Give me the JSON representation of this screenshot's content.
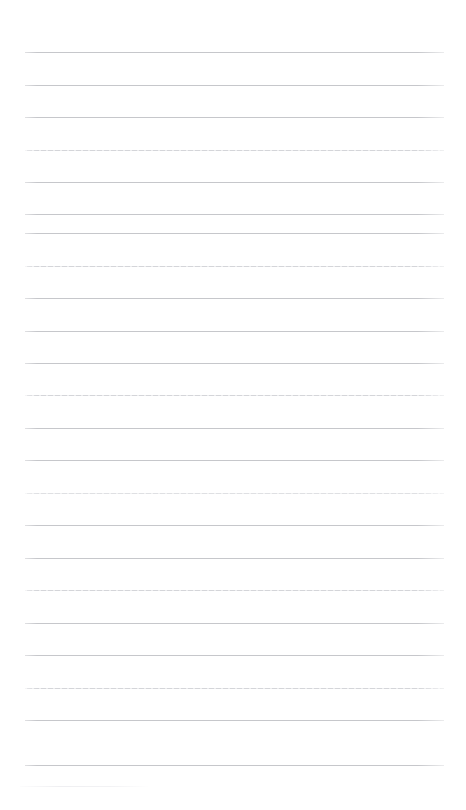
{
  "document": {
    "kind": "ruled-notebook-page",
    "title": "Blank ruled notebook page",
    "page_width": 466,
    "page_height": 810,
    "background_color": "#ffffff",
    "has_text_content": false,
    "has_header": false,
    "has_margin_rule": false,
    "written_text": ""
  },
  "ruling": {
    "line_color": "#c6c7cb",
    "faded_line_color": "#d4d5d9",
    "very_faded_line_color": "#dfe0e3",
    "line_thickness": 1,
    "line_count": 23,
    "line_left_x": 25,
    "line_right_x": 444,
    "line_length": 419,
    "first_line_y": 52,
    "last_line_y": 765,
    "line_spacing": 32.4,
    "lines": [
      {
        "index": 1,
        "y": 52,
        "tone": "normal"
      },
      {
        "index": 2,
        "y": 85,
        "tone": "normal"
      },
      {
        "index": 3,
        "y": 117,
        "tone": "normal"
      },
      {
        "index": 4,
        "y": 150,
        "tone": "faded"
      },
      {
        "index": 5,
        "y": 182,
        "tone": "normal"
      },
      {
        "index": 6,
        "y": 214,
        "tone": "normal"
      },
      {
        "index": 7,
        "y": 233,
        "tone": "normal"
      },
      {
        "index": 8,
        "y": 266,
        "tone": "faded"
      },
      {
        "index": 9,
        "y": 298,
        "tone": "normal"
      },
      {
        "index": 10,
        "y": 331,
        "tone": "normal"
      },
      {
        "index": 11,
        "y": 363,
        "tone": "normal"
      },
      {
        "index": 12,
        "y": 395,
        "tone": "faded"
      },
      {
        "index": 13,
        "y": 428,
        "tone": "normal"
      },
      {
        "index": 14,
        "y": 460,
        "tone": "normal"
      },
      {
        "index": 15,
        "y": 493,
        "tone": "very-faded"
      },
      {
        "index": 16,
        "y": 525,
        "tone": "normal"
      },
      {
        "index": 17,
        "y": 558,
        "tone": "normal"
      },
      {
        "index": 18,
        "y": 590,
        "tone": "faded"
      },
      {
        "index": 19,
        "y": 623,
        "tone": "normal"
      },
      {
        "index": 20,
        "y": 655,
        "tone": "normal"
      },
      {
        "index": 21,
        "y": 688,
        "tone": "faded"
      },
      {
        "index": 22,
        "y": 720,
        "tone": "normal"
      },
      {
        "index": 23,
        "y": 765,
        "tone": "normal"
      }
    ]
  },
  "artifacts": {
    "bottom_partial_line": {
      "present": true,
      "y": 786,
      "left_x": 20,
      "right_x": 150,
      "color": "#ededf0"
    }
  }
}
